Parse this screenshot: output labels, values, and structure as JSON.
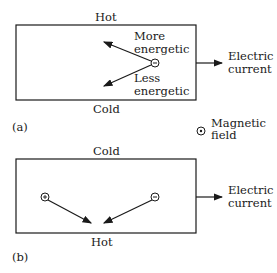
{
  "panel_a": {
    "label": "(a)",
    "top_label": "Hot",
    "bottom_label": "Cold",
    "particle": "negative-charge",
    "more_label_1": "More",
    "more_label_2": "energetic",
    "less_label_1": "Less",
    "less_label_2": "energetic",
    "current_label_1": "Electric",
    "current_label_2": "current"
  },
  "legend": {
    "symbol": "magnetic-field-out-of-page",
    "label_1": "Magnetic",
    "label_2": "field"
  },
  "panel_b": {
    "label": "(b)",
    "top_label": "Cold",
    "bottom_label": "Hot",
    "particles": [
      "positive-charge",
      "negative-charge"
    ],
    "current_label_1": "Electric",
    "current_label_2": "current"
  },
  "colors": {
    "ink": "#1a1a1a",
    "background": "#ffffff"
  }
}
